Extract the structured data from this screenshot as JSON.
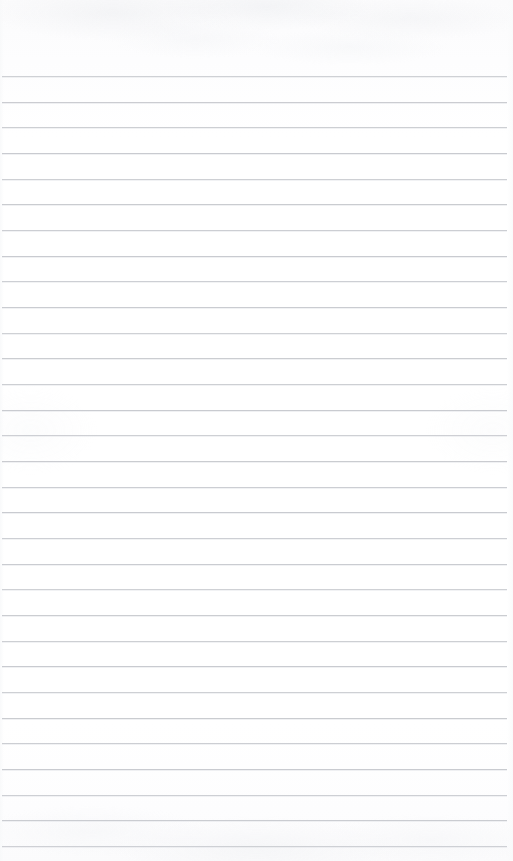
{
  "document": {
    "type": "scanned-lined-paper",
    "title": "Blank ruled notepad page",
    "content_text": "",
    "page_width": 513,
    "page_height": 861,
    "background_color": "#ffffff",
    "paper_tint": "#fdfdfe"
  },
  "ruling": {
    "line_color": "#c9cbd0",
    "line_thickness_px": 1,
    "line_count": 31,
    "first_line_y": 76,
    "line_spacing_px": 25.65,
    "line_left_x": 2,
    "line_right_x": 507,
    "top_margin_px": 76,
    "style": "wide-ruled",
    "left_margin_rule": "none",
    "lines_y": [
      76,
      102,
      127,
      153,
      179,
      204,
      230,
      256,
      281,
      307,
      333,
      358,
      384,
      410,
      435,
      461,
      487,
      512,
      538,
      564,
      589,
      615,
      641,
      666,
      692,
      718,
      743,
      769,
      795,
      820,
      846
    ]
  },
  "annotations": {
    "handwriting_present": "no",
    "printed_text_present": "no",
    "holes_or_perforations": "none"
  }
}
